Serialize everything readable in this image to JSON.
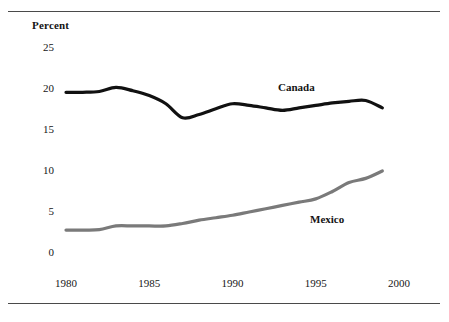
{
  "figure": {
    "percent_axis_label": "Percent",
    "top_rule": "horizontal-rule",
    "bottom_rule": "horizontal-rule"
  },
  "chart_data": {
    "type": "line",
    "title": "",
    "subtitle": "",
    "xlabel": "",
    "ylabel": "Percent",
    "xlim": [
      1980,
      2000
    ],
    "ylim": [
      0,
      25
    ],
    "xticks": [
      1980,
      1985,
      1990,
      1995,
      2000
    ],
    "xtick_labels": [
      "1980",
      "1985",
      "1990",
      "1995",
      "2000"
    ],
    "yticks": [
      0,
      5,
      10,
      15,
      20,
      25
    ],
    "ytick_labels": [
      "0",
      "5",
      "10",
      "15",
      "20",
      "25"
    ],
    "grid": false,
    "legend": "inline-series-labels",
    "annotations": [
      {
        "text": "Canada",
        "x": 1994.5,
        "y": 20.0
      },
      {
        "text": "Mexico",
        "x": 1996.5,
        "y": 4.6
      }
    ],
    "x": [
      1980,
      1981,
      1982,
      1983,
      1984,
      1985,
      1986,
      1987,
      1988,
      1989,
      1990,
      1991,
      1992,
      1993,
      1994,
      1995,
      1996,
      1997,
      1998,
      1999
    ],
    "series": [
      {
        "name": "Canada",
        "color": "#111111",
        "width": 3.2,
        "values": [
          19.6,
          19.6,
          19.7,
          20.2,
          19.8,
          19.2,
          18.2,
          16.5,
          16.9,
          17.6,
          18.2,
          18.0,
          17.7,
          17.4,
          17.7,
          18.0,
          18.3,
          18.5,
          18.6,
          17.7
        ]
      },
      {
        "name": "Mexico",
        "color": "#7a7a7a",
        "width": 3.2,
        "values": [
          2.8,
          2.8,
          2.85,
          3.3,
          3.3,
          3.3,
          3.3,
          3.6,
          4.0,
          4.3,
          4.6,
          5.0,
          5.4,
          5.8,
          6.2,
          6.6,
          7.5,
          8.6,
          9.1,
          10.0
        ]
      }
    ]
  }
}
